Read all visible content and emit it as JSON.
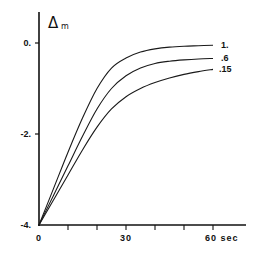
{
  "chart_data": {
    "type": "line",
    "title": "",
    "xlabel": "sec",
    "ylabel": "Δm",
    "xlim": [
      0,
      60
    ],
    "ylim": [
      -4,
      0.6
    ],
    "grid": false,
    "x_ticks": [
      0,
      10,
      20,
      30,
      40,
      50,
      60
    ],
    "x_tick_labels": [
      {
        "value": 0,
        "label": "0"
      },
      {
        "value": 30,
        "label": "30"
      },
      {
        "value": 60,
        "label": "60 sec"
      }
    ],
    "y_tick_labels": [
      {
        "value": 0,
        "label": "0."
      },
      {
        "value": -2,
        "label": "-2."
      },
      {
        "value": -4,
        "label": "-4."
      }
    ],
    "legend_position": "inline-right-end-of-curves",
    "x": [
      0,
      5,
      10,
      15,
      20,
      25,
      30,
      35,
      40,
      45,
      50,
      55,
      60
    ],
    "series": [
      {
        "name": "1.",
        "values": [
          -4.0,
          -3.2,
          -2.4,
          -1.65,
          -1.0,
          -0.55,
          -0.33,
          -0.2,
          -0.13,
          -0.09,
          -0.07,
          -0.06,
          -0.05
        ]
      },
      {
        "name": ".6",
        "values": [
          -4.0,
          -3.35,
          -2.7,
          -2.05,
          -1.45,
          -1.0,
          -0.72,
          -0.55,
          -0.45,
          -0.4,
          -0.37,
          -0.35,
          -0.34
        ]
      },
      {
        "name": ".15",
        "values": [
          -4.0,
          -3.45,
          -2.9,
          -2.35,
          -1.85,
          -1.45,
          -1.18,
          -1.0,
          -0.87,
          -0.77,
          -0.69,
          -0.63,
          -0.58
        ]
      }
    ]
  },
  "labels": {
    "y_symbol": "Δ",
    "y_subscript": "m",
    "x_unit": "sec"
  }
}
